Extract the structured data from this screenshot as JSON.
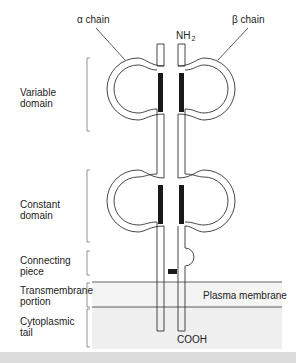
{
  "diagram": {
    "chain_labels": {
      "alpha": "α chain",
      "beta": "β chain"
    },
    "terminals": {
      "n_term_main": "NH",
      "n_term_sub": "2",
      "c_term": "COOH"
    },
    "regions": [
      {
        "line1": "Variable",
        "line2": "domain"
      },
      {
        "line1": "Constant",
        "line2": "domain"
      },
      {
        "line1": "Connecting",
        "line2": "piece"
      },
      {
        "line1": "Transmembrane",
        "line2": "portion"
      },
      {
        "line1": "Cytoplasmic",
        "line2": "tail"
      }
    ],
    "membrane_label": "Plasma membrane",
    "colors": {
      "stroke": "#333333",
      "disulfide": "#1a1a1a",
      "membrane_fill": "#f4f4f4",
      "cytoplasm_fill": "#efefef",
      "bottom_strip": "#dcdcdc"
    }
  }
}
